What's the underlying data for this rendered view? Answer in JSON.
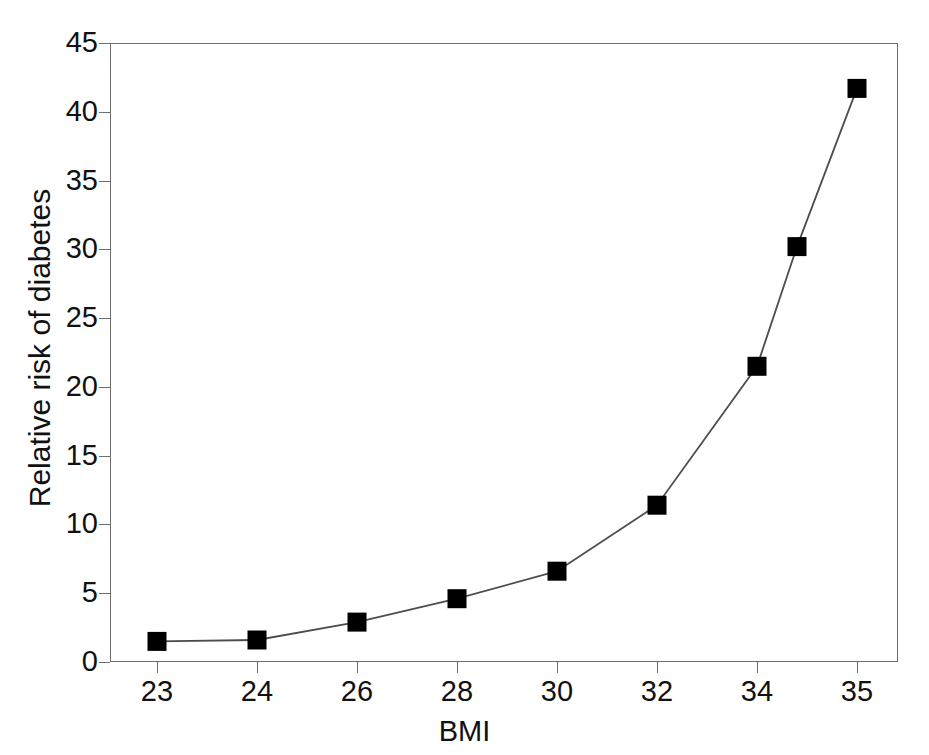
{
  "chart_data": {
    "type": "line",
    "title": "",
    "subtitle": "",
    "xlabel": "BMI",
    "ylabel": "Relative risk of diabetes",
    "categories": [
      "23",
      "24",
      "26",
      "28",
      "30",
      "32",
      "34",
      "34.5",
      "35"
    ],
    "x_tick_labels": [
      "23",
      "24",
      "26",
      "28",
      "30",
      "32",
      "34",
      "35"
    ],
    "y_tick_labels": [
      "0",
      "5",
      "10",
      "15",
      "20",
      "25",
      "30",
      "35",
      "40",
      "45"
    ],
    "y_ticks": [
      0,
      5,
      10,
      15,
      20,
      25,
      30,
      35,
      40,
      45
    ],
    "ylim": [
      0,
      45
    ],
    "grid": false,
    "legend": "none",
    "marker": "square",
    "marker_color": "#000000",
    "line_color": "#4d4d4d",
    "axis_color": "#6e6e6e",
    "background": "#ffffff",
    "series": [
      {
        "name": "Relative risk of diabetes",
        "points": [
          {
            "x": "23",
            "y": 1.5
          },
          {
            "x": "24",
            "y": 1.6
          },
          {
            "x": "26",
            "y": 2.9
          },
          {
            "x": "28",
            "y": 4.6
          },
          {
            "x": "30",
            "y": 6.6
          },
          {
            "x": "32",
            "y": 11.4
          },
          {
            "x": "34",
            "y": 21.5
          },
          {
            "x": "34.5",
            "y": 30.2
          },
          {
            "x": "35",
            "y": 41.7
          }
        ]
      }
    ]
  }
}
